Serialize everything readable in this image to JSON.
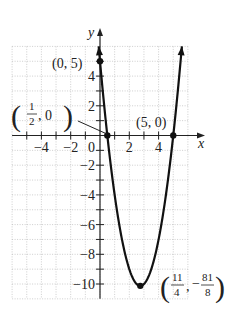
{
  "chart_data": {
    "type": "line",
    "title": "",
    "function": "y = 2x^2 - 11x + 5",
    "xlabel": "x",
    "ylabel": "y",
    "xlim": [
      -6,
      6
    ],
    "ylim": [
      -11,
      6
    ],
    "grid": true,
    "grid_style": "dotted",
    "x_ticks": [
      -4,
      -2,
      2,
      4
    ],
    "x_tick_labels": [
      "−4",
      "−2",
      "2",
      "4"
    ],
    "y_ticks": [
      -10,
      -8,
      -6,
      -4,
      -2,
      2,
      4
    ],
    "y_tick_labels": [
      "−10",
      "−8",
      "−6",
      "−4",
      "−2",
      "2",
      "4"
    ],
    "origin_label": "0",
    "series": [
      {
        "name": "parabola",
        "x": [
          -0.09,
          0,
          0.5,
          1,
          1.5,
          2,
          2.5,
          2.75,
          3,
          3.5,
          4,
          4.5,
          5,
          5.59
        ],
        "y": [
          6,
          5,
          0,
          -4,
          -7,
          -9,
          -10,
          -10.125,
          -10,
          -9,
          -7,
          -4,
          0,
          6
        ]
      }
    ],
    "points": [
      {
        "x": 0,
        "y": 5,
        "label": "(0, 5)"
      },
      {
        "x": 0.5,
        "y": 0,
        "label": "(1/2, 0)"
      },
      {
        "x": 5,
        "y": 0,
        "label": "(5, 0)"
      },
      {
        "x": 2.75,
        "y": -10.125,
        "label": "(11/4, −81/8)"
      }
    ],
    "annotations": {
      "pt_0_5": "(0, 5)",
      "pt_5_0": "(5, 0)",
      "half_num": "1",
      "half_den": "2",
      "half_rest": ", 0",
      "vx_num": "11",
      "vx_den": "4",
      "vy_sign": "−",
      "vy_num": "81",
      "vy_den": "8",
      "comma": ","
    },
    "colors": {
      "curve": "#111111",
      "grid": "#b8b8b8",
      "axis": "#222222"
    }
  }
}
